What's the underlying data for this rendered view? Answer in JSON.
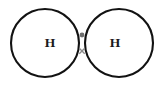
{
  "diagram": {
    "kind": "dot-and-cross-diagram",
    "molecule": "H2",
    "canvas": {
      "width": 164,
      "height": 86,
      "background": "#ffffff"
    },
    "stroke_color": "#121212",
    "atoms": [
      {
        "id": "left",
        "label": "H",
        "label_x": 50,
        "label_y": 42,
        "circle_cx": 45,
        "circle_cy": 43,
        "circle_r": 34
      },
      {
        "id": "right",
        "label": "H",
        "label_x": 115,
        "label_y": 42,
        "circle_cx": 119,
        "circle_cy": 43,
        "circle_r": 34
      }
    ],
    "shared_electrons": [
      {
        "id": "dot",
        "symbol": "•",
        "glyph_name": "electron-dot",
        "x": 82,
        "y": 35,
        "radius": 2.4,
        "color": "#6e6e6e"
      },
      {
        "id": "cross",
        "symbol": "×",
        "glyph_name": "electron-cross",
        "x": 82,
        "y": 51,
        "size": 5.4,
        "color": "#8a8a8a"
      }
    ],
    "overlap_region": {
      "name": "bonding-overlap-lens",
      "top_intersection_x": 82,
      "top_intersection_y": 18,
      "bottom_intersection_x": 82,
      "bottom_intersection_y": 68
    }
  }
}
